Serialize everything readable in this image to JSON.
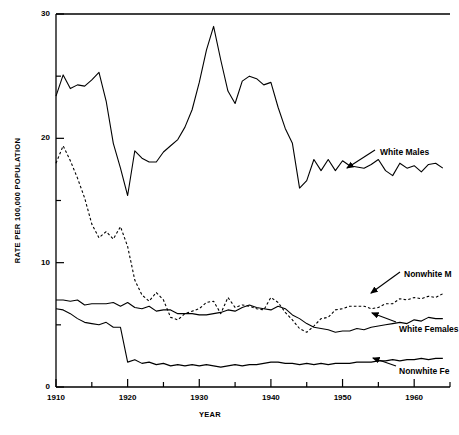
{
  "chart_data": {
    "type": "line",
    "title": "",
    "xlabel": "YEAR",
    "ylabel": "RATE PER 100,000 POPULATION",
    "xlim": [
      1910,
      1965
    ],
    "ylim": [
      0,
      30
    ],
    "yticks": [
      0,
      10,
      20,
      30
    ],
    "ytick_labels": [
      "0",
      "10",
      "20",
      "30"
    ],
    "yminor_step": 5,
    "xticks": [
      1910,
      1920,
      1930,
      1940,
      1950,
      1960
    ],
    "xtick_labels": [
      "1910",
      "1920",
      "1930",
      "1940",
      "1950",
      "1960"
    ],
    "xminor_step": 5,
    "grid": false,
    "legend_position": "inline-annotations",
    "x": [
      1910,
      1911,
      1912,
      1913,
      1914,
      1915,
      1916,
      1917,
      1918,
      1919,
      1920,
      1921,
      1922,
      1923,
      1924,
      1925,
      1926,
      1927,
      1928,
      1929,
      1930,
      1931,
      1932,
      1933,
      1934,
      1935,
      1936,
      1937,
      1938,
      1939,
      1940,
      1941,
      1942,
      1943,
      1944,
      1945,
      1946,
      1947,
      1948,
      1949,
      1950,
      1951,
      1952,
      1953,
      1954,
      1955,
      1956,
      1957,
      1958,
      1959,
      1960,
      1961,
      1962,
      1963,
      1964
    ],
    "series": [
      {
        "name": "White Males",
        "style": "solid",
        "annotation": "White Males",
        "values": [
          23.4,
          25.1,
          24.0,
          24.3,
          24.2,
          24.7,
          25.3,
          23.0,
          19.6,
          17.6,
          15.4,
          19.0,
          18.4,
          18.1,
          18.1,
          18.9,
          19.4,
          19.9,
          20.9,
          22.3,
          24.5,
          27.1,
          29.0,
          26.3,
          23.8,
          22.8,
          24.6,
          25.0,
          24.8,
          24.3,
          24.5,
          22.5,
          20.8,
          19.6,
          16.0,
          16.6,
          18.3,
          17.4,
          18.3,
          17.4,
          18.2,
          17.8,
          17.7,
          17.6,
          17.9,
          18.3,
          17.4,
          17.0,
          18.0,
          17.6,
          17.8,
          17.3,
          17.9,
          18.0,
          17.6
        ]
      },
      {
        "name": "Nonwhite Males",
        "style": "dashed",
        "annotation": "Nonwhite M",
        "values": [
          18.0,
          19.4,
          18.2,
          16.8,
          15.2,
          13.1,
          12.0,
          12.5,
          11.9,
          12.9,
          11.3,
          8.6,
          7.4,
          6.9,
          7.6,
          7.0,
          5.6,
          5.4,
          5.9,
          6.1,
          6.3,
          6.8,
          6.9,
          5.9,
          7.2,
          6.4,
          6.6,
          6.5,
          6.3,
          6.2,
          7.2,
          6.8,
          6.0,
          5.4,
          4.7,
          4.4,
          4.9,
          5.5,
          5.6,
          6.2,
          6.3,
          6.5,
          6.5,
          6.5,
          6.3,
          6.4,
          6.7,
          6.7,
          7.1,
          7.0,
          7.2,
          7.1,
          7.3,
          7.2,
          7.5
        ]
      },
      {
        "name": "White Females",
        "style": "solid",
        "annotation": "White Females",
        "values": [
          7.0,
          7.0,
          6.9,
          7.0,
          6.6,
          6.7,
          6.7,
          6.7,
          6.8,
          6.5,
          6.8,
          6.4,
          6.3,
          6.5,
          6.1,
          6.2,
          6.2,
          5.9,
          5.9,
          5.9,
          5.8,
          5.8,
          5.9,
          6.0,
          6.2,
          6.1,
          6.4,
          6.6,
          6.4,
          6.3,
          6.2,
          6.5,
          6.3,
          5.8,
          5.5,
          5.1,
          4.8,
          4.7,
          4.6,
          4.4,
          4.5,
          4.5,
          4.7,
          4.6,
          4.8,
          4.9,
          5.0,
          5.1,
          5.2,
          5.1,
          5.4,
          5.3,
          5.6,
          5.5,
          5.5
        ]
      },
      {
        "name": "Nonwhite Females",
        "style": "solid",
        "annotation": "Nonwhite Fe",
        "values": [
          6.3,
          6.2,
          5.9,
          5.5,
          5.2,
          5.1,
          5.0,
          5.2,
          4.8,
          4.8,
          2.0,
          2.2,
          1.9,
          2.0,
          1.8,
          1.9,
          1.7,
          1.8,
          1.7,
          1.8,
          1.7,
          1.8,
          1.7,
          1.6,
          1.7,
          1.8,
          1.7,
          1.8,
          1.8,
          1.9,
          2.0,
          2.0,
          1.9,
          1.9,
          1.8,
          1.9,
          1.8,
          1.9,
          1.8,
          1.9,
          1.9,
          1.9,
          2.0,
          2.0,
          2.0,
          2.1,
          2.1,
          2.2,
          2.1,
          2.2,
          2.2,
          2.3,
          2.2,
          2.3,
          2.3
        ]
      }
    ],
    "annotations": [
      {
        "label": "White Males",
        "x": 380,
        "y": 147
      },
      {
        "label": "Nonwhite M",
        "x": 404,
        "y": 269
      },
      {
        "label": "White Females",
        "x": 399,
        "y": 324
      },
      {
        "label": "Nonwhite Fe",
        "x": 399,
        "y": 366
      }
    ],
    "colors": {
      "line": "#000000",
      "background": "#ffffff"
    }
  }
}
